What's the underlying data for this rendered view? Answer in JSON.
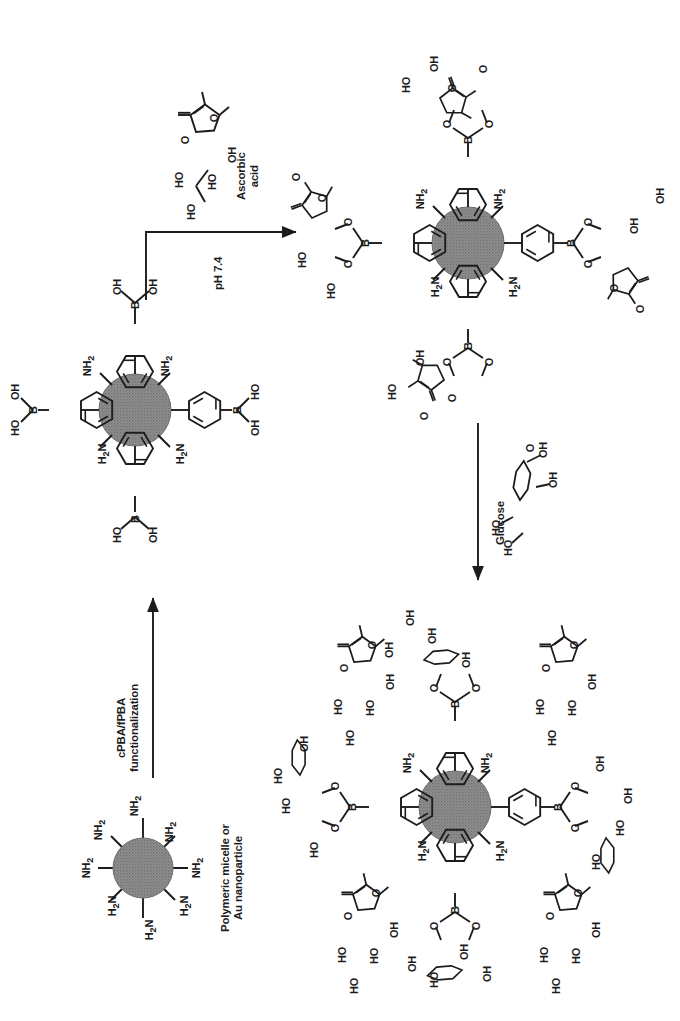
{
  "figure": {
    "type": "chemical-reaction-scheme",
    "orientation_deg": 90,
    "background": "#ffffff",
    "ink_color": "#1c1c1c",
    "nanoparticle_color": "#8a8a8a",
    "title": ""
  },
  "labels": {
    "starting_material": {
      "line1": "Polymeric micelle or",
      "line2": "Au nanoparticle"
    },
    "step1_arrow": {
      "line1": "cPBA/fPBA",
      "line2": "functionalization"
    },
    "reagent_ascorbic": {
      "line1": "Ascorbic",
      "line2": "acid"
    },
    "step2_arrow": "pH 7.4",
    "step3_arrow": "Glucose"
  },
  "chemical_groups": {
    "amine": "NH2",
    "amine_rev": "H2N",
    "hydroxyl": "OH",
    "hydroxyl_rev": "HO",
    "boron": "B",
    "oxygen": "O"
  },
  "structures": [
    {
      "id": "amine-nanoparticle",
      "name": "Amine-functionalized nanoparticle",
      "caption": "Polymeric micelle or Au nanoparticle",
      "core": "sphere",
      "arm_count": 8,
      "arm_labels": [
        "NH2",
        "NH2",
        "NH2",
        "NH2",
        "H2N",
        "H2N",
        "H2N",
        "NH2"
      ]
    },
    {
      "id": "pba-nanoparticle",
      "name": "cPBA/fPBA functionalized nanoparticle",
      "core": "sphere",
      "amine_labels": [
        "NH2",
        "NH2",
        "H2N",
        "H2N"
      ],
      "arm_count": 4,
      "arm_group": "phenylboronic acid",
      "arm_terminus": [
        "HO",
        "OH"
      ]
    },
    {
      "id": "ascorbate-boronate-nanoparticle",
      "name": "Ascorbic-acid boronate ester nanoparticle",
      "core": "sphere",
      "amine_labels": [
        "NH2",
        "NH2",
        "H2N",
        "H2N"
      ],
      "arm_count": 4,
      "arm_group": "phenylboronate ascorbate ester"
    },
    {
      "id": "glucose-exchanged-nanoparticle",
      "name": "Glucose-exchanged nanoparticle with released ascorbic acid",
      "core": "sphere",
      "amine_labels": [
        "NH2",
        "NH2",
        "H2N",
        "H2N"
      ],
      "arm_count": 4,
      "arm_group": "phenylboronate glucose ester",
      "released_species": "Ascorbic acid",
      "released_count": 4
    }
  ],
  "arrows": [
    {
      "id": "arrow-functionalization",
      "label": "cPBA/fPBA functionalization",
      "direction": "up"
    },
    {
      "id": "arrow-ph",
      "label": "pH 7.4",
      "direction": "right",
      "shape": "bent"
    },
    {
      "id": "arrow-glucose",
      "label": "Glucose",
      "direction": "down"
    }
  ]
}
